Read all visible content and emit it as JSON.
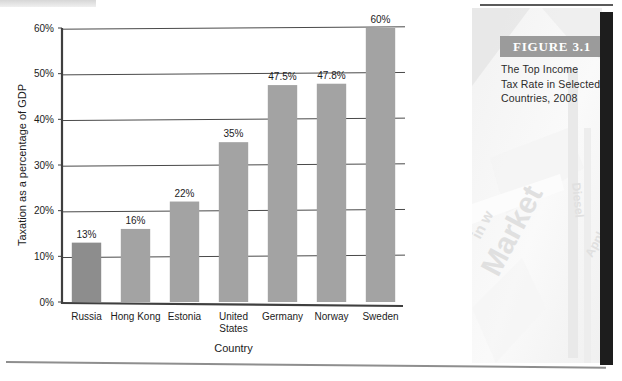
{
  "figure": {
    "banner_label": "FIGURE 3.1",
    "caption_lines": [
      "The Top Income",
      "Tax Rate in Selected",
      "Countries, 2008"
    ],
    "banner_bg": "#9b9b9b",
    "photo_keywords": [
      "Market",
      "Diesel"
    ]
  },
  "chart_data": {
    "type": "bar",
    "title": "",
    "xlabel": "Country",
    "ylabel": "Taxation as a percentage of GDP",
    "categories": [
      "Russia",
      "Hong Kong",
      "Estonia",
      "United States",
      "Germany",
      "Norway",
      "Sweden"
    ],
    "values": [
      13,
      16,
      22,
      35,
      47.5,
      47.8,
      60
    ],
    "data_labels": [
      "13%",
      "16%",
      "22%",
      "35%",
      "47.5%",
      "47.8%",
      "60%"
    ],
    "ylim": [
      0,
      60
    ],
    "yticks": [
      0,
      10,
      20,
      30,
      40,
      50,
      60
    ],
    "ytick_labels": [
      "0%",
      "10%",
      "20%",
      "30%",
      "40%",
      "50%",
      "60%"
    ],
    "grid": "horizontal",
    "legend": "none",
    "bar_colors": [
      "#8d8d8d",
      "#a3a3a3",
      "#a3a3a3",
      "#a3a3a3",
      "#a3a3a3",
      "#a3a3a3",
      "#a3a3a3"
    ],
    "axis_color": "#3f3f3f",
    "gridline_color": "#4a4a4a"
  }
}
